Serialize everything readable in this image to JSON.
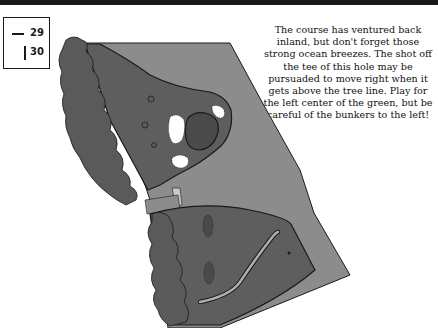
{
  "header": {
    "bar_color": "#1a1a1a"
  },
  "legend": {
    "items": [
      {
        "symbol": "horizontal-line",
        "value": "29"
      },
      {
        "symbol": "vertical-line",
        "value": "30"
      }
    ]
  },
  "hole_description": "The course has ventured back inland, but don't forget those strong ocean breezes. The shot off the tee of this hole may be pursuaded to move right when it gets above the tree line. Play for the left center of the green, but be careful of the bunkers to the left!",
  "map": {
    "colors": {
      "rough": "#8c8c8c",
      "fairway": "#5e5e5e",
      "trees": "#5a5a5a",
      "green": "#4a4a4a",
      "bunker": "#ffffff",
      "cart_path": "#b0b0b0",
      "outline": "#1a1a1a"
    },
    "features": [
      "tee-box",
      "fairway",
      "green",
      "bunkers",
      "trees",
      "cart-path",
      "bridge",
      "rough",
      "flag-marker"
    ]
  }
}
